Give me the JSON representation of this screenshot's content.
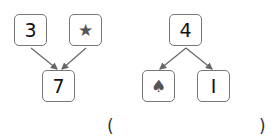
{
  "left_diagram": {
    "top_left": "3",
    "top_right": "★",
    "bottom": "7",
    "top_right_icon": "star-icon"
  },
  "right_diagram": {
    "top": "4",
    "bottom_left": "♠",
    "bottom_right": "I",
    "bottom_left_icon": "spade-icon"
  },
  "answer": {
    "open_paren": "(",
    "close_paren": ")"
  }
}
